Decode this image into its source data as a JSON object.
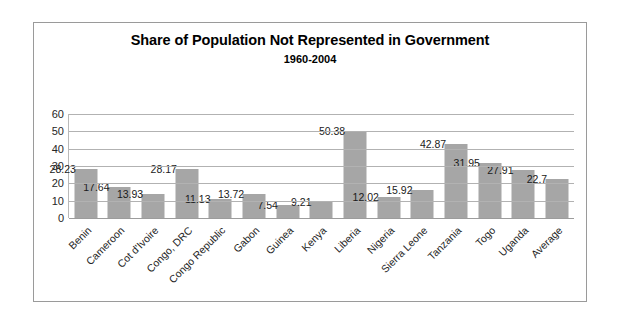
{
  "chart_data": {
    "type": "bar",
    "title": "Share of Population Not Represented in Government",
    "subtitle": "1960-2004",
    "xlabel": "",
    "ylabel": "",
    "ylim": [
      0,
      60
    ],
    "yticks": [
      60,
      50,
      40,
      30,
      20,
      10,
      0
    ],
    "grid": true,
    "legend": "none",
    "bar_color": "#a6a6a6",
    "categories": [
      "Benin",
      "Cameroon",
      "Cot d'Ivoire",
      "Congo, DRC",
      "Congo Republic",
      "Gabon",
      "Guinea",
      "Kenya",
      "Liberia",
      "Nigeria",
      "Sierra Leone",
      "Tanzania",
      "Togo",
      "Uganda",
      "Average"
    ],
    "values": [
      28.23,
      17.64,
      13.93,
      28.17,
      11.13,
      13.72,
      7.54,
      9.21,
      50.38,
      12.02,
      15.92,
      42.87,
      31.95,
      27.91,
      22.7
    ],
    "data_labels": [
      "28.23",
      "17.64",
      "13.93",
      "28.17",
      "11.13",
      "13.72",
      "7.54",
      "9.21",
      "50.38",
      "12.02",
      "15.92",
      "42.87",
      "31.95",
      "27.91",
      "22.7"
    ]
  }
}
